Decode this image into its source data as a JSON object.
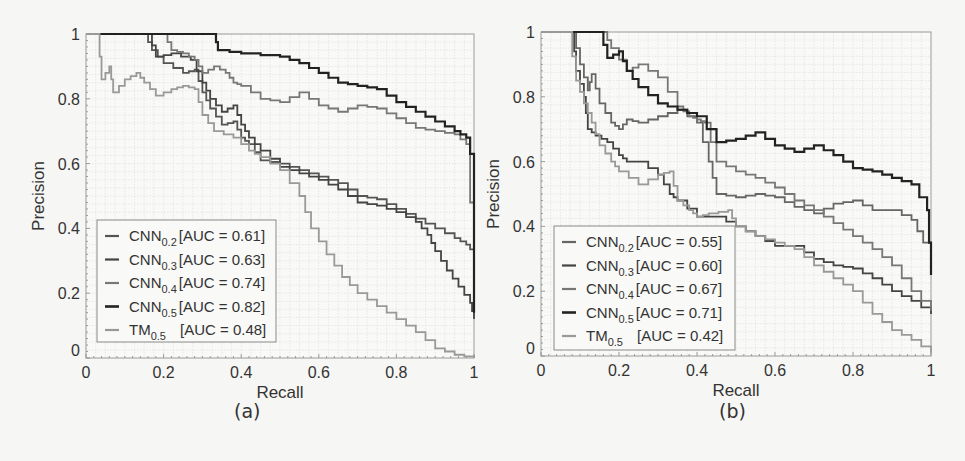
{
  "chart_data": [
    {
      "type": "line",
      "panel": "(a)",
      "xlabel": "Recall",
      "ylabel": "Precision",
      "xlim": [
        0,
        1
      ],
      "ylim": [
        0,
        1
      ],
      "xticks": [
        "0",
        "0.2",
        "0.4",
        "0.6",
        "0.8",
        "1"
      ],
      "yticks": [
        "0",
        "0.2",
        "0.4",
        "0.6",
        "0.8",
        "1"
      ],
      "grid": true,
      "legend_position": "lower left",
      "series": [
        {
          "name": "CNN",
          "sub": "0.2",
          "auc": "[AUC = 0.61]",
          "color": "#555555",
          "width": 1.8,
          "x": [
            0,
            0.15,
            0.17,
            0.2,
            0.25,
            0.28,
            0.3,
            0.32,
            0.35,
            0.38,
            0.4,
            0.42,
            0.45,
            0.5,
            0.55,
            0.6,
            0.65,
            0.7,
            0.75,
            0.8,
            0.85,
            0.9,
            0.95,
            0.98,
            1.0
          ],
          "y": [
            1,
            1,
            0.95,
            0.91,
            0.88,
            0.89,
            0.82,
            0.77,
            0.72,
            0.73,
            0.68,
            0.66,
            0.61,
            0.6,
            0.58,
            0.56,
            0.54,
            0.5,
            0.49,
            0.46,
            0.43,
            0.4,
            0.37,
            0.35,
            0.32
          ]
        },
        {
          "name": "CNN",
          "sub": "0.3",
          "auc": "[AUC = 0.63]",
          "color": "#444444",
          "width": 1.8,
          "x": [
            0,
            0.16,
            0.18,
            0.22,
            0.27,
            0.3,
            0.32,
            0.35,
            0.38,
            0.4,
            0.42,
            0.45,
            0.5,
            0.55,
            0.6,
            0.65,
            0.7,
            0.75,
            0.8,
            0.85,
            0.88,
            0.9,
            0.93,
            0.96,
            0.99,
            1.0
          ],
          "y": [
            1,
            1,
            0.93,
            0.94,
            0.92,
            0.85,
            0.8,
            0.76,
            0.78,
            0.72,
            0.68,
            0.64,
            0.59,
            0.57,
            0.55,
            0.52,
            0.48,
            0.47,
            0.45,
            0.42,
            0.38,
            0.33,
            0.27,
            0.22,
            0.17,
            0.12
          ]
        },
        {
          "name": "CNN",
          "sub": "0.4",
          "auc": "[AUC = 0.74]",
          "color": "#777777",
          "width": 1.8,
          "x": [
            0,
            0.2,
            0.22,
            0.25,
            0.28,
            0.3,
            0.33,
            0.36,
            0.38,
            0.4,
            0.45,
            0.5,
            0.55,
            0.6,
            0.65,
            0.7,
            0.75,
            0.8,
            0.85,
            0.9,
            0.95,
            0.98,
            1.0
          ],
          "y": [
            1,
            1,
            0.95,
            0.94,
            0.92,
            0.88,
            0.9,
            0.88,
            0.85,
            0.84,
            0.8,
            0.79,
            0.82,
            0.78,
            0.76,
            0.78,
            0.77,
            0.74,
            0.71,
            0.7,
            0.69,
            0.66,
            0.3
          ]
        },
        {
          "name": "CNN",
          "sub": "0.5",
          "auc": "[AUC = 0.82]",
          "color": "#222222",
          "width": 2.2,
          "x": [
            0,
            0.33,
            0.34,
            0.4,
            0.5,
            0.55,
            0.6,
            0.65,
            0.7,
            0.75,
            0.8,
            0.85,
            0.9,
            0.95,
            0.98,
            1.0,
            1.0
          ],
          "y": [
            1,
            1,
            0.95,
            0.94,
            0.93,
            0.91,
            0.88,
            0.85,
            0.84,
            0.83,
            0.79,
            0.76,
            0.73,
            0.7,
            0.68,
            0.58,
            0.14
          ]
        },
        {
          "name": "TM",
          "sub": "0.5",
          "auc": "[AUC = 0.48]",
          "color": "#999999",
          "width": 1.8,
          "x": [
            0,
            0.03,
            0.04,
            0.06,
            0.07,
            0.1,
            0.13,
            0.15,
            0.18,
            0.22,
            0.25,
            0.28,
            0.3,
            0.33,
            0.38,
            0.42,
            0.45,
            0.5,
            0.55,
            0.58,
            0.62,
            0.66,
            0.7,
            0.75,
            0.8,
            0.85,
            0.9,
            0.95,
            1.0
          ],
          "y": [
            1,
            1,
            0.86,
            0.9,
            0.82,
            0.86,
            0.88,
            0.85,
            0.81,
            0.83,
            0.84,
            0.83,
            0.75,
            0.7,
            0.68,
            0.64,
            0.62,
            0.58,
            0.5,
            0.4,
            0.32,
            0.25,
            0.2,
            0.16,
            0.12,
            0.08,
            0.03,
            0.01,
            0.0
          ]
        }
      ]
    },
    {
      "type": "line",
      "panel": "(b)",
      "xlabel": "Recall",
      "ylabel": "Precision",
      "xlim": [
        0,
        1
      ],
      "ylim": [
        0,
        1
      ],
      "xticks": [
        "0",
        "0.2",
        "0.4",
        "0.6",
        "0.8",
        "1"
      ],
      "yticks": [
        "0",
        "0.2",
        "0.4",
        "0.6",
        "0.8",
        "1"
      ],
      "grid": true,
      "legend_position": "lower left",
      "series": [
        {
          "name": "CNN",
          "sub": "0.2",
          "auc": "[AUC = 0.55]",
          "color": "#666666",
          "width": 1.8,
          "x": [
            0,
            0.08,
            0.1,
            0.12,
            0.13,
            0.15,
            0.18,
            0.2,
            0.22,
            0.25,
            0.3,
            0.35,
            0.4,
            0.43,
            0.45,
            0.5,
            0.55,
            0.6,
            0.65,
            0.7,
            0.75,
            0.8,
            0.85,
            0.9,
            0.95,
            0.98,
            1.0
          ],
          "y": [
            1,
            1,
            0.9,
            0.82,
            0.87,
            0.78,
            0.72,
            0.7,
            0.73,
            0.72,
            0.74,
            0.76,
            0.72,
            0.6,
            0.5,
            0.49,
            0.5,
            0.49,
            0.46,
            0.44,
            0.47,
            0.48,
            0.45,
            0.45,
            0.42,
            0.35,
            0.35
          ]
        },
        {
          "name": "CNN",
          "sub": "0.3",
          "auc": "[AUC = 0.60]",
          "color": "#444444",
          "width": 1.8,
          "x": [
            0,
            0.08,
            0.09,
            0.11,
            0.12,
            0.14,
            0.17,
            0.2,
            0.22,
            0.25,
            0.3,
            0.33,
            0.35,
            0.4,
            0.45,
            0.5,
            0.55,
            0.6,
            0.65,
            0.7,
            0.75,
            0.8,
            0.85,
            0.9,
            0.95,
            1.0
          ],
          "y": [
            1,
            1,
            0.88,
            0.8,
            0.7,
            0.68,
            0.66,
            0.62,
            0.6,
            0.6,
            0.56,
            0.5,
            0.48,
            0.43,
            0.43,
            0.4,
            0.37,
            0.34,
            0.34,
            0.3,
            0.28,
            0.27,
            0.24,
            0.2,
            0.17,
            0.13
          ]
        },
        {
          "name": "CNN",
          "sub": "0.4",
          "auc": "[AUC = 0.67]",
          "color": "#777777",
          "width": 1.8,
          "x": [
            0,
            0.16,
            0.18,
            0.22,
            0.25,
            0.3,
            0.35,
            0.38,
            0.4,
            0.42,
            0.45,
            0.5,
            0.55,
            0.6,
            0.65,
            0.7,
            0.75,
            0.8,
            0.85,
            0.9,
            0.95,
            1.0
          ],
          "y": [
            1,
            1,
            0.95,
            0.88,
            0.9,
            0.86,
            0.77,
            0.74,
            0.73,
            0.72,
            0.6,
            0.57,
            0.55,
            0.52,
            0.48,
            0.45,
            0.41,
            0.37,
            0.33,
            0.28,
            0.2,
            0.14
          ]
        },
        {
          "name": "CNN",
          "sub": "0.5",
          "auc": "[AUC = 0.71]",
          "color": "#222222",
          "width": 2.2,
          "x": [
            0,
            0.15,
            0.17,
            0.2,
            0.22,
            0.25,
            0.3,
            0.35,
            0.4,
            0.45,
            0.5,
            0.55,
            0.6,
            0.65,
            0.7,
            0.75,
            0.8,
            0.85,
            0.9,
            0.95,
            0.99,
            1.0
          ],
          "y": [
            1,
            1,
            0.92,
            0.94,
            0.88,
            0.83,
            0.78,
            0.76,
            0.74,
            0.66,
            0.67,
            0.69,
            0.65,
            0.63,
            0.65,
            0.62,
            0.58,
            0.57,
            0.55,
            0.53,
            0.45,
            0.25
          ]
        },
        {
          "name": "TM",
          "sub": "0.5",
          "auc": "[AUC = 0.42]",
          "color": "#999999",
          "width": 1.8,
          "x": [
            0,
            0.07,
            0.09,
            0.11,
            0.13,
            0.15,
            0.18,
            0.2,
            0.25,
            0.3,
            0.33,
            0.35,
            0.38,
            0.4,
            0.43,
            0.48,
            0.5,
            0.55,
            0.6,
            0.65,
            0.7,
            0.75,
            0.8,
            0.85,
            0.9,
            0.95,
            1.0
          ],
          "y": [
            1,
            1,
            0.85,
            0.78,
            0.72,
            0.65,
            0.6,
            0.57,
            0.53,
            0.56,
            0.57,
            0.48,
            0.45,
            0.43,
            0.44,
            0.45,
            0.4,
            0.37,
            0.35,
            0.33,
            0.28,
            0.24,
            0.2,
            0.13,
            0.08,
            0.05,
            0.01
          ]
        }
      ]
    }
  ],
  "captions": {
    "a": "(a)",
    "b": "(b)"
  },
  "axis_labels": {
    "x": "Recall",
    "y": "Precision"
  }
}
